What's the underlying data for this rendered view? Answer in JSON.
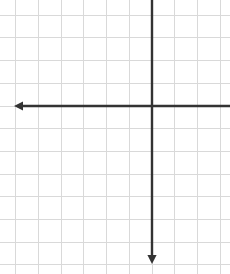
{
  "canvas": {
    "width": 230,
    "height": 274,
    "background_color": "#ffffff",
    "title": "Blank coordinate plane grid"
  },
  "chart_data": {
    "type": "scatter",
    "title": "",
    "subtitle": "",
    "xlabel": "",
    "ylabel": "",
    "series": [],
    "x": [],
    "values": [],
    "annotations": [],
    "legend": {
      "entries": [],
      "position": "none",
      "visible": false
    },
    "grid": {
      "visible": true,
      "color": "#d9d9d9",
      "line_width": 1,
      "spacing_px": 22.7,
      "origin_x_px": 152,
      "origin_y_px": 106,
      "vertical_line_count": 10,
      "horizontal_line_count": 12,
      "first_vertical_x_px": 15,
      "first_horizontal_y_px": 13
    },
    "axes": {
      "color": "#333333",
      "line_width": 2.4,
      "x_axis": {
        "y_px": 106,
        "start_px": 14,
        "end_px": 230,
        "arrow_start": true,
        "arrow_end": false,
        "tick_labels": [],
        "xlim": [
          -6,
          3.4
        ]
      },
      "y_axis": {
        "x_px": 152,
        "start_px": 0,
        "end_px": 264,
        "arrow_start": false,
        "arrow_end": true,
        "tick_labels": [],
        "ylim": [
          -7,
          4.7
        ]
      }
    },
    "tick_labels": {
      "x": [],
      "y": []
    }
  },
  "icons": {
    "x_axis_arrow": "arrow-left-icon",
    "y_axis_arrow": "arrow-down-icon"
  }
}
